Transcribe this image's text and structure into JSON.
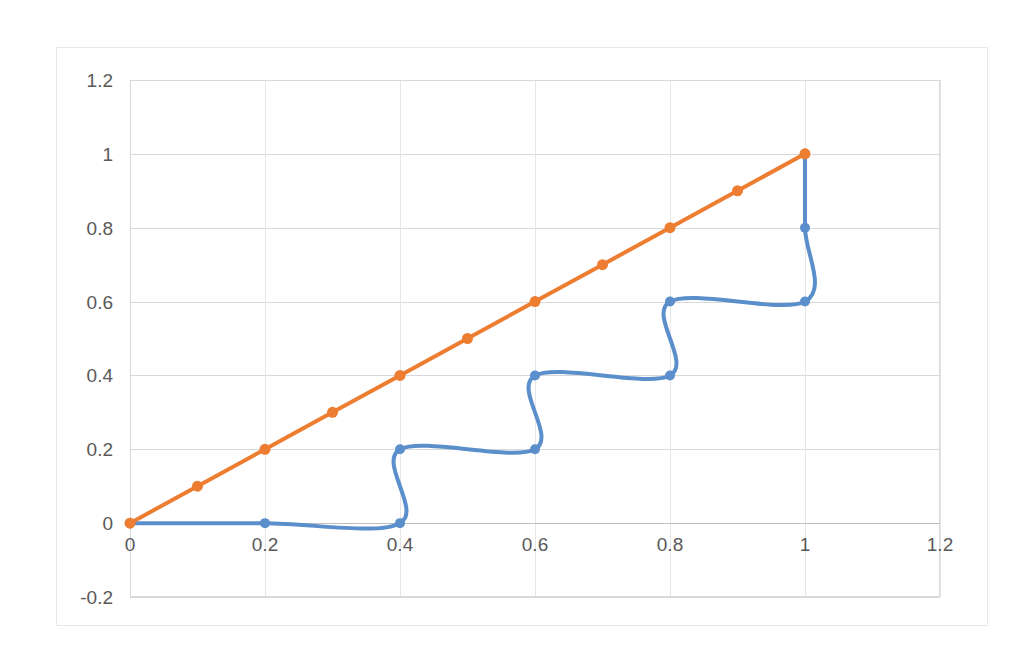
{
  "chart_data": {
    "type": "line",
    "title": "",
    "subtitle": "",
    "xlabel": "",
    "ylabel": "",
    "xlim": [
      0,
      1.2
    ],
    "ylim": [
      -0.2,
      1.2
    ],
    "grid": true,
    "legend": "none",
    "smooth": true,
    "x_ticks": [
      "0",
      "0.2",
      "0.4",
      "0.6",
      "0.8",
      "1",
      "1.2"
    ],
    "x_tick_values": [
      0,
      0.2,
      0.4,
      0.6,
      0.8,
      1,
      1.2
    ],
    "y_ticks": [
      "-0.2",
      "0",
      "0.2",
      "0.4",
      "0.6",
      "0.8",
      "1",
      "1.2"
    ],
    "y_tick_values": [
      -0.2,
      0,
      0.2,
      0.4,
      0.6,
      0.8,
      1,
      1.2
    ],
    "series": [
      {
        "name": "Series 1",
        "color": "#5B8FCB",
        "marker": "circle",
        "marker_size": 10,
        "line_width": 4,
        "points": [
          {
            "x": 0.0,
            "y": 0.0
          },
          {
            "x": 0.2,
            "y": 0.0
          },
          {
            "x": 0.4,
            "y": 0.0
          },
          {
            "x": 0.4,
            "y": 0.2
          },
          {
            "x": 0.6,
            "y": 0.2
          },
          {
            "x": 0.6,
            "y": 0.4
          },
          {
            "x": 0.8,
            "y": 0.4
          },
          {
            "x": 0.8,
            "y": 0.6
          },
          {
            "x": 1.0,
            "y": 0.6
          },
          {
            "x": 1.0,
            "y": 0.8
          },
          {
            "x": 1.0,
            "y": 1.0
          }
        ]
      },
      {
        "name": "Series 2",
        "color": "#ED7D31",
        "marker": "circle",
        "marker_size": 11,
        "line_width": 4,
        "points": [
          {
            "x": 0.0,
            "y": 0.0
          },
          {
            "x": 0.1,
            "y": 0.1
          },
          {
            "x": 0.2,
            "y": 0.2
          },
          {
            "x": 0.3,
            "y": 0.3
          },
          {
            "x": 0.4,
            "y": 0.4
          },
          {
            "x": 0.5,
            "y": 0.5
          },
          {
            "x": 0.6,
            "y": 0.6
          },
          {
            "x": 0.7,
            "y": 0.7
          },
          {
            "x": 0.8,
            "y": 0.8
          },
          {
            "x": 0.9,
            "y": 0.9
          },
          {
            "x": 1.0,
            "y": 1.0
          }
        ]
      }
    ]
  },
  "colors": {
    "series1": "#5B8FCB",
    "series2": "#ED7D31",
    "gridline": "#d9d9d9",
    "axis": "#bfbfbf",
    "tick_text": "#595959",
    "chart_border": "#e8e8e8",
    "background": "#ffffff"
  },
  "geometry": {
    "plot_left": 130,
    "plot_right": 940,
    "plot_top": 80,
    "plot_bottom": 597,
    "zero_y": 520
  }
}
